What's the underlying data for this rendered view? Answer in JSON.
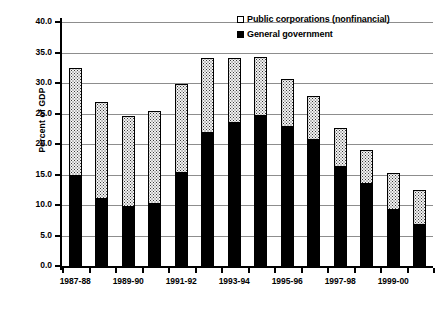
{
  "chart_data": {
    "type": "bar",
    "stacked": true,
    "title": "",
    "subtitle": "",
    "xlabel": "",
    "ylabel": "Percent of GDP",
    "ylim": [
      0.0,
      40.0
    ],
    "ytick_step": 5.0,
    "ytick_labels": [
      "0.0",
      "5.0",
      "10.0",
      "15.0",
      "20.0",
      "25.0",
      "30.0",
      "35.0",
      "40.0"
    ],
    "ytick_values": [
      0.0,
      5.0,
      10.0,
      15.0,
      20.0,
      25.0,
      30.0,
      35.0,
      40.0
    ],
    "grid": true,
    "grid_axis": "y",
    "legend_position": "top-right",
    "categories": [
      "1987-88",
      "1988-89",
      "1989-90",
      "1990-91",
      "1991-92",
      "1992-93",
      "1993-94",
      "1994-95",
      "1995-96",
      "1996-97",
      "1997-98",
      "1998-99",
      "1999-00",
      "2000-01"
    ],
    "xtick_labels": [
      "1987-88",
      "1989-90",
      "1991-92",
      "1993-94",
      "1995-96",
      "1997-98",
      "1999-00"
    ],
    "xtick_label_indices": [
      0,
      2,
      4,
      6,
      8,
      10,
      12
    ],
    "series": [
      {
        "name": "General government",
        "fill": "solid-black",
        "color": "#000000",
        "values": [
          14.9,
          11.2,
          9.8,
          10.3,
          15.4,
          21.9,
          23.6,
          24.8,
          23.0,
          20.9,
          16.4,
          13.6,
          9.4,
          6.9
        ]
      },
      {
        "name": "Public corporations (nonfinancial)",
        "fill": "dotted-light",
        "color": "#f2f2f2",
        "values": [
          17.7,
          15.9,
          15.0,
          15.3,
          14.6,
          12.4,
          10.7,
          9.7,
          7.9,
          7.2,
          6.4,
          5.6,
          6.0,
          5.8
        ]
      }
    ],
    "totals": [
      32.6,
      27.1,
      24.8,
      25.6,
      30.0,
      34.3,
      34.3,
      34.5,
      30.9,
      28.1,
      22.8,
      19.2,
      15.4,
      12.7
    ]
  },
  "legend": {
    "items": [
      {
        "label": "Public corporations (nonfinancial)",
        "swatch": "pub"
      },
      {
        "label": "General government",
        "swatch": "gov"
      }
    ]
  },
  "axis": {
    "y_title": "Percent of GDP"
  }
}
